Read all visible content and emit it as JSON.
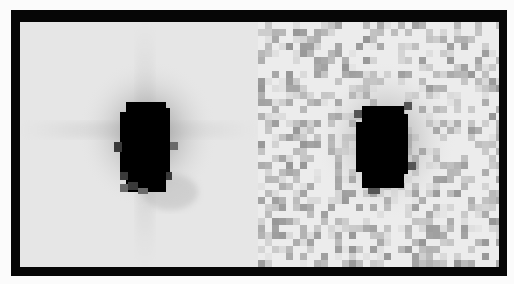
{
  "figure": {
    "frame_color": "#060606",
    "background_color": "#fbfbfb",
    "panels": [
      {
        "id": "left",
        "kind": "smooth image",
        "background_gray": "#e6e6e6",
        "source_center": [
          125,
          108
        ],
        "core_color": "#000000",
        "features": [
          "dark saturated core",
          "diffuse halo",
          "faint horizontal and vertical spikes"
        ]
      },
      {
        "id": "right",
        "kind": "noisy pixelated image",
        "background_gray": "#ececec",
        "source_center": [
          127,
          108
        ],
        "core_color": "#000000",
        "features": [
          "dark saturated core",
          "speckled gray pixel noise"
        ]
      }
    ]
  }
}
